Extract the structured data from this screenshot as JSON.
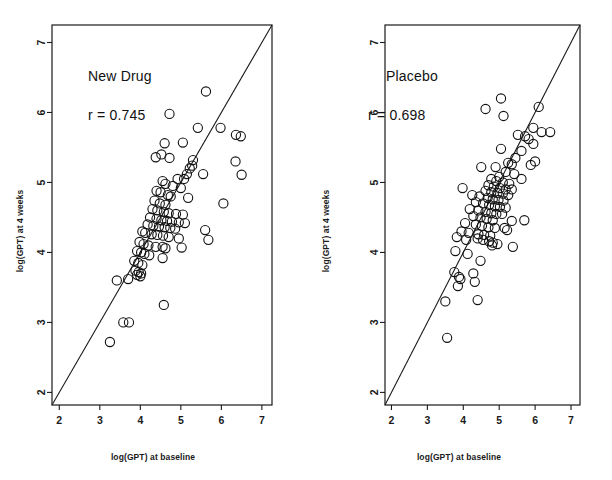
{
  "figure": {
    "background": "#ffffff",
    "foreground": "#1a1a1a",
    "width": 612,
    "height": 480
  },
  "chart_data": [
    {
      "type": "scatter",
      "panel": "left",
      "title": "New Drug",
      "annotation": "r = 0.745",
      "correlation": 0.745,
      "xlabel": "log(GPT) at baseline",
      "ylabel": "log(GPT) at 4 weeks",
      "xlim": [
        1.82,
        7.25
      ],
      "ylim": [
        1.82,
        7.25
      ],
      "xticks": [
        2,
        3,
        4,
        5,
        6,
        7
      ],
      "yticks": [
        2,
        3,
        4,
        5,
        6,
        7
      ],
      "xticklabels": [
        "2",
        "3",
        "4",
        "5",
        "6",
        "7"
      ],
      "yticklabels": [
        "2",
        "3",
        "4",
        "5",
        "6",
        "7"
      ],
      "grid": false,
      "legend": "none",
      "reference_line": {
        "kind": "identity",
        "label": "y = x",
        "from": [
          1.82,
          1.82
        ],
        "to": [
          7.25,
          7.25
        ]
      },
      "marker": {
        "shape": "open-circle",
        "radius_px": 4.6,
        "color": "#111111",
        "fill": "none"
      },
      "points": [
        [
          5.62,
          6.3
        ],
        [
          4.72,
          5.98
        ],
        [
          5.42,
          5.78
        ],
        [
          5.98,
          5.78
        ],
        [
          6.36,
          5.68
        ],
        [
          6.48,
          5.66
        ],
        [
          4.6,
          5.56
        ],
        [
          5.05,
          5.57
        ],
        [
          4.38,
          5.36
        ],
        [
          4.52,
          5.4
        ],
        [
          4.72,
          5.35
        ],
        [
          5.3,
          5.32
        ],
        [
          6.35,
          5.3
        ],
        [
          5.28,
          5.24
        ],
        [
          5.22,
          5.2
        ],
        [
          5.15,
          5.12
        ],
        [
          6.5,
          5.11
        ],
        [
          5.55,
          5.12
        ],
        [
          5.08,
          5.05
        ],
        [
          4.92,
          5.05
        ],
        [
          4.55,
          5.02
        ],
        [
          4.62,
          4.98
        ],
        [
          4.8,
          4.95
        ],
        [
          5.0,
          4.92
        ],
        [
          4.4,
          4.88
        ],
        [
          4.5,
          4.86
        ],
        [
          4.68,
          4.82
        ],
        [
          4.75,
          4.8
        ],
        [
          5.18,
          4.78
        ],
        [
          4.35,
          4.74
        ],
        [
          4.48,
          4.7
        ],
        [
          4.62,
          4.68
        ],
        [
          6.05,
          4.7
        ],
        [
          4.3,
          4.62
        ],
        [
          4.42,
          4.6
        ],
        [
          4.58,
          4.58
        ],
        [
          4.7,
          4.56
        ],
        [
          4.88,
          4.55
        ],
        [
          5.05,
          4.54
        ],
        [
          4.24,
          4.5
        ],
        [
          4.4,
          4.48
        ],
        [
          4.52,
          4.46
        ],
        [
          4.66,
          4.45
        ],
        [
          4.78,
          4.44
        ],
        [
          4.95,
          4.43
        ],
        [
          5.1,
          4.42
        ],
        [
          4.18,
          4.4
        ],
        [
          4.32,
          4.38
        ],
        [
          4.46,
          4.37
        ],
        [
          4.6,
          4.36
        ],
        [
          4.74,
          4.35
        ],
        [
          4.86,
          4.34
        ],
        [
          5.6,
          4.32
        ],
        [
          4.05,
          4.3
        ],
        [
          4.12,
          4.28
        ],
        [
          4.28,
          4.26
        ],
        [
          4.42,
          4.25
        ],
        [
          4.56,
          4.24
        ],
        [
          4.7,
          4.22
        ],
        [
          4.95,
          4.2
        ],
        [
          5.68,
          4.18
        ],
        [
          3.98,
          4.15
        ],
        [
          4.08,
          4.12
        ],
        [
          4.2,
          4.1
        ],
        [
          4.38,
          4.08
        ],
        [
          4.55,
          4.08
        ],
        [
          4.62,
          4.06
        ],
        [
          5.02,
          4.07
        ],
        [
          3.92,
          4.02
        ],
        [
          4.02,
          4.0
        ],
        [
          4.1,
          3.98
        ],
        [
          4.22,
          3.96
        ],
        [
          4.55,
          3.92
        ],
        [
          3.85,
          3.88
        ],
        [
          3.95,
          3.85
        ],
        [
          4.05,
          3.82
        ],
        [
          3.88,
          3.74
        ],
        [
          3.96,
          3.72
        ],
        [
          4.02,
          3.7
        ],
        [
          3.92,
          3.68
        ],
        [
          4.0,
          3.66
        ],
        [
          3.42,
          3.6
        ],
        [
          3.7,
          3.62
        ],
        [
          4.58,
          3.25
        ],
        [
          3.58,
          3.0
        ],
        [
          3.72,
          3.0
        ],
        [
          3.25,
          2.72
        ]
      ]
    },
    {
      "type": "scatter",
      "panel": "right",
      "title": "Placebo",
      "annotation": "r = 0.698",
      "correlation": 0.698,
      "xlabel": "log(GPT) at baseline",
      "ylabel": "log(GPT) at 4 weeks",
      "xlim": [
        1.82,
        7.25
      ],
      "ylim": [
        1.82,
        7.25
      ],
      "xticks": [
        2,
        3,
        4,
        5,
        6,
        7
      ],
      "yticks": [
        2,
        3,
        4,
        5,
        6,
        7
      ],
      "xticklabels": [
        "2",
        "3",
        "4",
        "5",
        "6",
        "7"
      ],
      "yticklabels": [
        "2",
        "3",
        "4",
        "5",
        "6",
        "7"
      ],
      "grid": false,
      "legend": "none",
      "reference_line": {
        "kind": "identity",
        "label": "y = x",
        "from": [
          1.82,
          1.82
        ],
        "to": [
          7.25,
          7.25
        ]
      },
      "marker": {
        "shape": "open-circle",
        "radius_px": 4.6,
        "color": "#111111",
        "fill": "none"
      },
      "points": [
        [
          5.05,
          6.2
        ],
        [
          6.1,
          6.08
        ],
        [
          4.62,
          6.05
        ],
        [
          5.12,
          5.95
        ],
        [
          5.95,
          5.78
        ],
        [
          6.18,
          5.72
        ],
        [
          5.52,
          5.68
        ],
        [
          5.72,
          5.66
        ],
        [
          5.82,
          5.62
        ],
        [
          6.42,
          5.72
        ],
        [
          5.95,
          5.55
        ],
        [
          5.05,
          5.48
        ],
        [
          5.62,
          5.45
        ],
        [
          5.45,
          5.35
        ],
        [
          6.0,
          5.3
        ],
        [
          5.25,
          5.28
        ],
        [
          5.35,
          5.26
        ],
        [
          5.88,
          5.25
        ],
        [
          4.5,
          5.22
        ],
        [
          4.9,
          5.22
        ],
        [
          5.18,
          5.15
        ],
        [
          5.42,
          5.12
        ],
        [
          5.0,
          5.08
        ],
        [
          5.62,
          5.05
        ],
        [
          4.78,
          5.05
        ],
        [
          4.92,
          5.02
        ],
        [
          5.1,
          5.0
        ],
        [
          5.28,
          4.98
        ],
        [
          4.7,
          4.96
        ],
        [
          4.85,
          4.94
        ],
        [
          5.02,
          4.92
        ],
        [
          5.18,
          4.9
        ],
        [
          5.35,
          4.9
        ],
        [
          3.98,
          4.92
        ],
        [
          4.62,
          4.88
        ],
        [
          4.78,
          4.86
        ],
        [
          4.95,
          4.85
        ],
        [
          5.1,
          4.84
        ],
        [
          5.25,
          4.82
        ],
        [
          4.25,
          4.82
        ],
        [
          4.45,
          4.8
        ],
        [
          4.68,
          4.78
        ],
        [
          4.82,
          4.76
        ],
        [
          4.98,
          4.75
        ],
        [
          5.12,
          4.74
        ],
        [
          4.35,
          4.72
        ],
        [
          4.55,
          4.7
        ],
        [
          4.72,
          4.68
        ],
        [
          4.88,
          4.66
        ],
        [
          5.02,
          4.65
        ],
        [
          5.18,
          4.64
        ],
        [
          4.18,
          4.62
        ],
        [
          4.42,
          4.6
        ],
        [
          4.62,
          4.58
        ],
        [
          4.78,
          4.56
        ],
        [
          4.92,
          4.55
        ],
        [
          5.08,
          4.55
        ],
        [
          4.28,
          4.52
        ],
        [
          4.48,
          4.5
        ],
        [
          4.65,
          4.48
        ],
        [
          4.82,
          4.46
        ],
        [
          5.35,
          4.45
        ],
        [
          5.7,
          4.46
        ],
        [
          4.05,
          4.42
        ],
        [
          4.35,
          4.4
        ],
        [
          4.52,
          4.38
        ],
        [
          4.7,
          4.36
        ],
        [
          4.88,
          4.35
        ],
        [
          5.15,
          4.35
        ],
        [
          5.22,
          4.32
        ],
        [
          3.95,
          4.3
        ],
        [
          4.15,
          4.28
        ],
        [
          4.42,
          4.26
        ],
        [
          4.58,
          4.25
        ],
        [
          4.75,
          4.24
        ],
        [
          4.4,
          4.2
        ],
        [
          4.55,
          4.18
        ],
        [
          4.72,
          4.16
        ],
        [
          4.82,
          4.14
        ],
        [
          4.95,
          4.12
        ],
        [
          3.82,
          4.22
        ],
        [
          4.08,
          4.18
        ],
        [
          4.8,
          4.1
        ],
        [
          5.38,
          4.08
        ],
        [
          3.78,
          4.02
        ],
        [
          4.12,
          3.98
        ],
        [
          4.48,
          3.88
        ],
        [
          3.75,
          3.72
        ],
        [
          4.28,
          3.7
        ],
        [
          3.88,
          3.65
        ],
        [
          3.92,
          3.62
        ],
        [
          4.32,
          3.58
        ],
        [
          3.85,
          3.52
        ],
        [
          4.4,
          3.32
        ],
        [
          3.5,
          3.3
        ],
        [
          3.55,
          2.78
        ]
      ]
    }
  ]
}
